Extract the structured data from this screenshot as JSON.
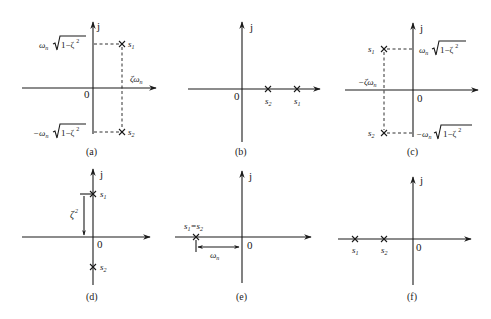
{
  "figure": {
    "type": "pole-zero s-plane diagrams (second-order system roots)",
    "axis_labels": {
      "imag": "j",
      "origin": "0"
    },
    "panels": [
      {
        "id": "a",
        "caption": "(a)",
        "poles": [
          {
            "name": "s1",
            "position": "upper-right"
          },
          {
            "name": "s2",
            "position": "lower-right"
          }
        ],
        "labels": {
          "upper": "ωn√(1−ζ²)",
          "upper_omega": "ω",
          "upper_sub": "n",
          "upper_root": "1−ζ",
          "upper_sup": "2",
          "lower": "−ωn√(1−ζ²)",
          "lower_omega": "−ω",
          "lower_sub": "n",
          "lower_root": "1−ζ",
          "lower_sup": "2",
          "real": "ζωn",
          "real_main": "ζω",
          "real_sub": "n",
          "s1": "s",
          "s1_sub": "1",
          "s2": "s",
          "s2_sub": "2"
        }
      },
      {
        "id": "b",
        "caption": "(b)",
        "poles": [
          {
            "name": "s2",
            "position": "positive real, nearer"
          },
          {
            "name": "s1",
            "position": "positive real, farther"
          }
        ],
        "labels": {
          "s1": "s",
          "s1_sub": "1",
          "s2": "s",
          "s2_sub": "2"
        }
      },
      {
        "id": "c",
        "caption": "(c)",
        "poles": [
          {
            "name": "s1",
            "position": "upper-left"
          },
          {
            "name": "s2",
            "position": "lower-left"
          }
        ],
        "labels": {
          "upper": "ωn√(1−ζ²)",
          "upper_omega": "ω",
          "upper_sub": "n",
          "upper_root": "1−ζ",
          "upper_sup": "2",
          "lower": "−ωn√(1−ζ²)",
          "lower_omega": "−ω",
          "lower_sub": "n",
          "lower_root": "1−ζ",
          "lower_sup": "2",
          "real": "−ζωn",
          "real_main": "−ζω",
          "real_sub": "n",
          "s1": "s",
          "s1_sub": "1",
          "s2": "s",
          "s2_sub": "2"
        }
      },
      {
        "id": "d",
        "caption": "(d)",
        "poles": [
          {
            "name": "s1",
            "position": "positive imaginary axis"
          },
          {
            "name": "s2",
            "position": "negative imaginary axis"
          }
        ],
        "labels": {
          "dim": "ζ²",
          "dim_main": "ζ",
          "dim_sup": "2",
          "s1": "s",
          "s1_sub": "1",
          "s2": "s",
          "s2_sub": "2"
        }
      },
      {
        "id": "e",
        "caption": "(e)",
        "poles": [
          {
            "name": "s1=s2",
            "position": "negative real (double)"
          }
        ],
        "labels": {
          "double": "s1=s2",
          "d_s": "s",
          "d_1": "1",
          "d_eq": "=s",
          "d_2": "2",
          "dim": "ωn",
          "dim_main": "ω",
          "dim_sub": "n"
        }
      },
      {
        "id": "f",
        "caption": "(f)",
        "poles": [
          {
            "name": "s1",
            "position": "negative real, farther"
          },
          {
            "name": "s2",
            "position": "negative real, nearer"
          }
        ],
        "labels": {
          "s1": "s",
          "s1_sub": "1",
          "s2": "s",
          "s2_sub": "2"
        }
      }
    ]
  }
}
